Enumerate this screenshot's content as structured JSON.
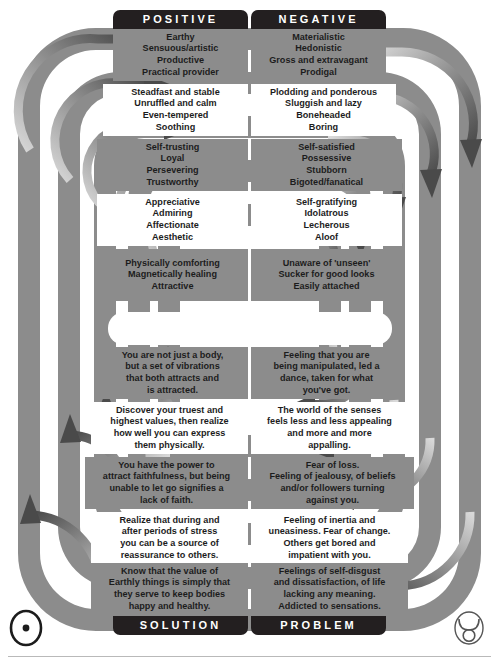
{
  "diagram": {
    "title_top_left": "POSITIVE",
    "title_top_right": "NEGATIVE",
    "title_bottom_left": "SOLUTION",
    "title_bottom_right": "PROBLEM",
    "sun_symbol": "☉",
    "taurus_symbol": "♉",
    "colors": {
      "band": "#8c8c8c",
      "header": "#231f20",
      "arrow_dark": "#5d5d5d",
      "text": "#1c1c1c",
      "page": "#ffffff"
    }
  },
  "rows": [
    {
      "tone": "shade",
      "positive": [
        "Earthy",
        "Sensuous/artistic",
        "Productive",
        "Practical provider"
      ],
      "negative": [
        "Materialistic",
        "Hedonistic",
        "Gross and extravagant",
        "Prodigal"
      ]
    },
    {
      "tone": "light",
      "positive": [
        "Steadfast and stable",
        "Unruffled and calm",
        "Even-tempered",
        "Soothing"
      ],
      "negative": [
        "Plodding and ponderous",
        "Sluggish and lazy",
        "Boneheaded",
        "Boring"
      ]
    },
    {
      "tone": "shade",
      "positive": [
        "Self-trusting",
        "Loyal",
        "Persevering",
        "Trustworthy"
      ],
      "negative": [
        "Self-satisfied",
        "Possessive",
        "Stubborn",
        "Bigoted/fanatical"
      ]
    },
    {
      "tone": "light",
      "positive": [
        "Appreciative",
        "Admiring",
        "Affectionate",
        "Aesthetic"
      ],
      "negative": [
        "Self-gratifying",
        "Idolatrous",
        "Lecherous",
        "Aloof"
      ]
    },
    {
      "tone": "shade",
      "positive": [
        "Physically comforting",
        "Magnetically healing",
        "Attractive"
      ],
      "negative": [
        "Unaware of 'unseen'",
        "Sucker for good looks",
        "Easily attached"
      ]
    },
    {
      "tone": "shade",
      "positive": [
        "You are not just a body,",
        "but a set of vibrations",
        "that both attracts and",
        "is attracted."
      ],
      "negative": [
        "Feeling that you are",
        "being manipulated, led a",
        "dance, taken for what",
        "you've got."
      ]
    },
    {
      "tone": "light",
      "positive": [
        "Discover your truest and",
        "highest values, then realize",
        "how well you can express",
        "them physically."
      ],
      "negative": [
        "The world of the senses",
        "feels less and less appealing",
        "and more and more",
        "appalling."
      ]
    },
    {
      "tone": "shade",
      "positive": [
        "You have the power to",
        "attract faithfulness, but being",
        "unable to let go signifies a",
        "lack of faith."
      ],
      "negative": [
        "Fear of loss.",
        "Feeling of jealousy, of beliefs",
        "and/or followers turning",
        "against you."
      ]
    },
    {
      "tone": "light",
      "positive": [
        "Realize that during and",
        "after periods of stress",
        "you can be a source of",
        "reassurance to others."
      ],
      "negative": [
        "Feeling of inertia and",
        "uneasiness. Fear of change.",
        "Others get bored and",
        "impatient with you."
      ]
    },
    {
      "tone": "shade",
      "positive": [
        "Know that the value of",
        "Earthly things is simply that",
        "they serve to keep bodies",
        "happy and healthy."
      ],
      "negative": [
        "Feelings of self-disgust",
        "and dissatisfaction, of life",
        "lacking any meaning.",
        "Addicted to sensations."
      ]
    }
  ]
}
